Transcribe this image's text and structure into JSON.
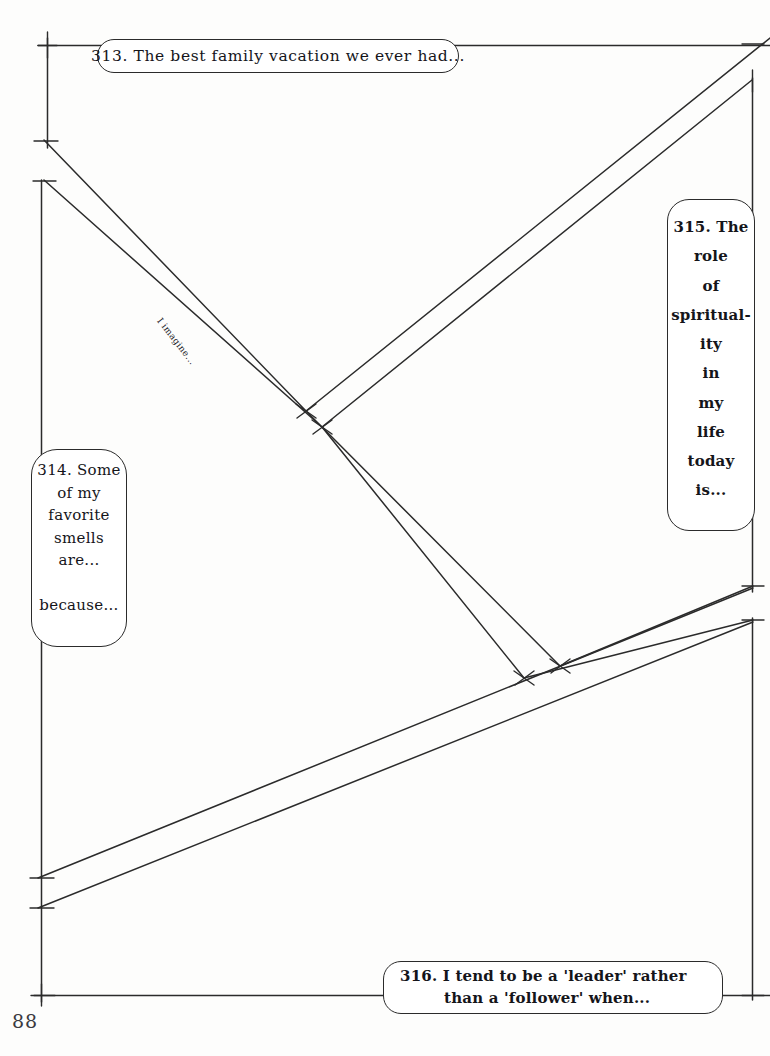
{
  "page": {
    "number": "88",
    "kind": "journal-prompt-worksheet",
    "background_color": "#fdfdfc",
    "ink_color": "#2b2b2b"
  },
  "prompts": [
    {
      "id": "313",
      "number": "313.",
      "text": "313. The best family vacation we ever had...",
      "orientation": "horizontal",
      "position": "top"
    },
    {
      "id": "314",
      "number": "314",
      "text": "314. Some\nof my\nfavorite\nsmells\nare...\n\nbecause...",
      "orientation": "vertical",
      "position": "left"
    },
    {
      "id": "315",
      "number": "315.",
      "first_line": "315. The",
      "stacked_words": [
        "role",
        "of",
        "spiritual-",
        "ity",
        "in",
        "my",
        "life",
        "today",
        "is..."
      ],
      "text": "315. The\nrole\nof\nspiritual-\nity\nin\nmy\nlife\ntoday\nis...",
      "orientation": "vertical",
      "position": "right"
    },
    {
      "id": "316",
      "number": "316.",
      "line1": "316. I tend to be a 'leader' rather",
      "line2": "than a 'follower' when...",
      "orientation": "horizontal",
      "position": "bottom"
    }
  ],
  "inline_labels": [
    {
      "id": "imagine",
      "text": "I imagine...",
      "rotation_deg": 52
    }
  ],
  "geometry": {
    "stroke_color": "#2b2b2b",
    "stroke_width": 1.5,
    "description": "hand-drawn ruled guide lines: left and right verticals, top and bottom horizontals, two descending diagonal pairs and two ascending diagonal pairs forming chevron junctions"
  }
}
